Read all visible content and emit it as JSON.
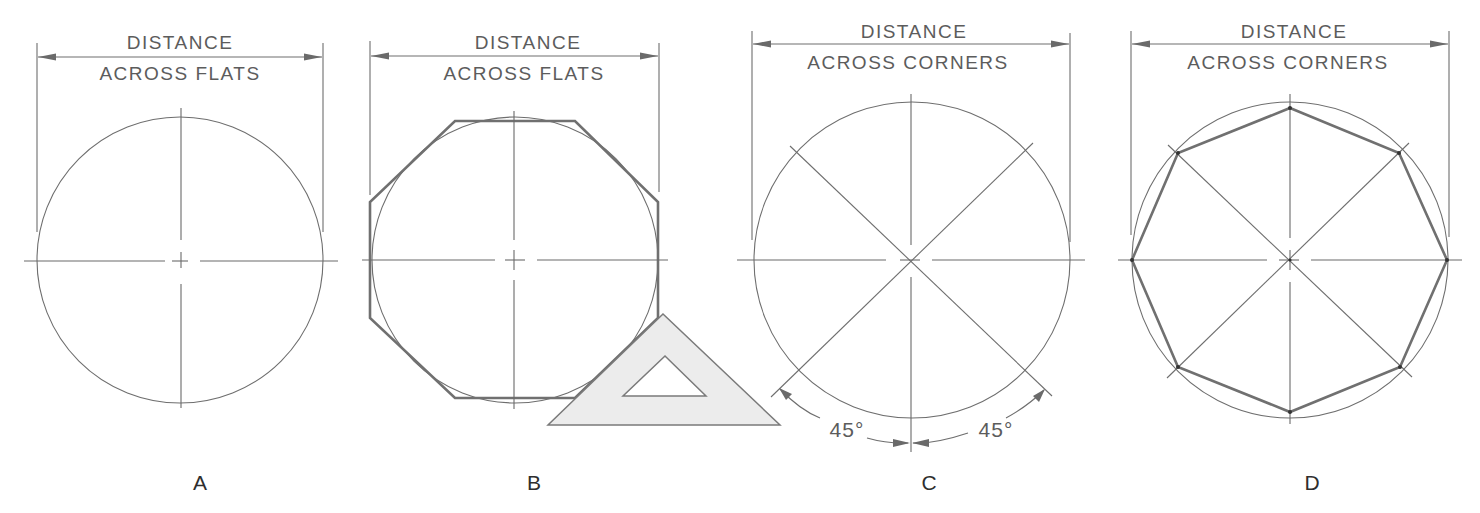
{
  "figure": {
    "colors": {
      "line": "#6e6e6e",
      "text": "#5c5c5c",
      "label": "#2e2e2e",
      "triangle_fill": "#ececec",
      "background": "#ffffff"
    },
    "panels": [
      {
        "id": "A",
        "label": "A",
        "dimension_line1": "DISTANCE",
        "dimension_line2": "ACROSS FLATS",
        "description": "Circle with centerlines; distance across flats dimensioned"
      },
      {
        "id": "B",
        "label": "B",
        "dimension_line1": "DISTANCE",
        "dimension_line2": "ACROSS FLATS",
        "description": "Octagon circumscribed around circle using 45-degree triangle"
      },
      {
        "id": "C",
        "label": "C",
        "dimension_line1": "DISTANCE",
        "dimension_line2": "ACROSS CORNERS",
        "description": "Circle with 45-degree diagonals",
        "angle_left": "45°",
        "angle_right": "45°"
      },
      {
        "id": "D",
        "label": "D",
        "dimension_line1": "DISTANCE",
        "dimension_line2": "ACROSS CORNERS",
        "description": "Octagon inscribed in circle with corners on centerlines and diagonals"
      }
    ]
  }
}
